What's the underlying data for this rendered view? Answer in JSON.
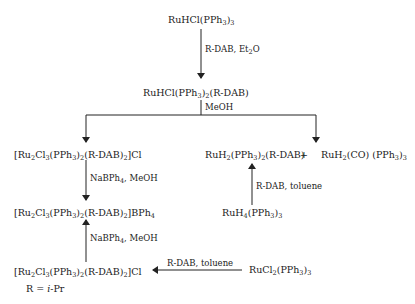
{
  "compounds": {
    "start": {
      "parts": [
        [
          "RuHCl(PPh",
          ""
        ],
        [
          "3",
          "sub"
        ],
        [
          ")",
          ""
        ],
        [
          "3",
          "sub"
        ]
      ]
    },
    "intermediate": {
      "parts": [
        [
          "RuHCl(PPh",
          ""
        ],
        [
          "3",
          "sub"
        ],
        [
          ")",
          ""
        ],
        [
          "2",
          "sub"
        ],
        [
          "(R-DAB)",
          ""
        ]
      ]
    },
    "ru2_chloride_top": {
      "parts": [
        [
          "[Ru",
          ""
        ],
        [
          "2",
          "sub"
        ],
        [
          "Cl",
          ""
        ],
        [
          "3",
          "sub"
        ],
        [
          "(PPh",
          ""
        ],
        [
          "3",
          "sub"
        ],
        [
          ")",
          ""
        ],
        [
          "2",
          "sub"
        ],
        [
          "(R-DAB)",
          ""
        ],
        [
          "2",
          "sub"
        ],
        [
          "]Cl",
          ""
        ]
      ]
    },
    "ru2_bph4": {
      "parts": [
        [
          "[Ru",
          ""
        ],
        [
          "2",
          "sub"
        ],
        [
          "Cl",
          ""
        ],
        [
          "3",
          "sub"
        ],
        [
          "(PPh",
          ""
        ],
        [
          "3",
          "sub"
        ],
        [
          ")",
          ""
        ],
        [
          "2",
          "sub"
        ],
        [
          "(R-DAB)",
          ""
        ],
        [
          "2",
          "sub"
        ],
        [
          "]BPh",
          ""
        ],
        [
          "4",
          "sub"
        ]
      ]
    },
    "ru2_chloride_bottom": {
      "parts": [
        [
          "[Ru",
          ""
        ],
        [
          "2",
          "sub"
        ],
        [
          "Cl",
          ""
        ],
        [
          "3",
          "sub"
        ],
        [
          "(PPh",
          ""
        ],
        [
          "3",
          "sub"
        ],
        [
          ")",
          ""
        ],
        [
          "2",
          "sub"
        ],
        [
          "(R-DAB)",
          ""
        ],
        [
          "2",
          "sub"
        ],
        [
          "]Cl",
          ""
        ]
      ]
    },
    "ruh2_dab": {
      "parts": [
        [
          "RuH",
          ""
        ],
        [
          "2",
          "sub"
        ],
        [
          "(PPh",
          ""
        ],
        [
          "3",
          "sub"
        ],
        [
          ")",
          ""
        ],
        [
          "2",
          "sub"
        ],
        [
          "(R-DAB)",
          ""
        ]
      ]
    },
    "plus": {
      "parts": [
        [
          "+",
          ""
        ]
      ]
    },
    "ruh2_co": {
      "parts": [
        [
          "RuH",
          ""
        ],
        [
          "2",
          "sub"
        ],
        [
          "(CO) (PPh",
          ""
        ],
        [
          "3",
          "sub"
        ],
        [
          ")",
          ""
        ],
        [
          "3",
          "sub"
        ]
      ]
    },
    "ruh4": {
      "parts": [
        [
          "RuH",
          ""
        ],
        [
          "4",
          "sub"
        ],
        [
          "(PPh",
          ""
        ],
        [
          "3",
          "sub"
        ],
        [
          ")",
          ""
        ],
        [
          "3",
          "sub"
        ]
      ]
    },
    "rucl2": {
      "parts": [
        [
          "RuCl",
          ""
        ],
        [
          "2",
          "sub"
        ],
        [
          "(PPh",
          ""
        ],
        [
          "3",
          "sub"
        ],
        [
          ")",
          ""
        ],
        [
          "3",
          "sub"
        ]
      ]
    }
  },
  "conditions": {
    "step1": {
      "parts": [
        [
          "R-DAB, Et",
          ""
        ],
        [
          "2",
          "sub"
        ],
        [
          "O",
          ""
        ]
      ]
    },
    "step2": {
      "parts": [
        [
          "MeOH",
          ""
        ]
      ]
    },
    "step3": {
      "parts": [
        [
          "NaBPh",
          ""
        ],
        [
          "4",
          "sub"
        ],
        [
          ", MeOH",
          ""
        ]
      ]
    },
    "step4": {
      "parts": [
        [
          "NaBPh",
          ""
        ],
        [
          "4",
          "sub"
        ],
        [
          ", MeOH",
          ""
        ]
      ]
    },
    "step5": {
      "parts": [
        [
          "R-DAB, toluene",
          ""
        ]
      ]
    },
    "step6": {
      "parts": [
        [
          "R-DAB, toluene",
          ""
        ]
      ]
    }
  },
  "footnote": {
    "parts": [
      [
        "R = ",
        ""
      ],
      [
        "i",
        "ital"
      ],
      [
        "-Pr",
        ""
      ]
    ]
  }
}
